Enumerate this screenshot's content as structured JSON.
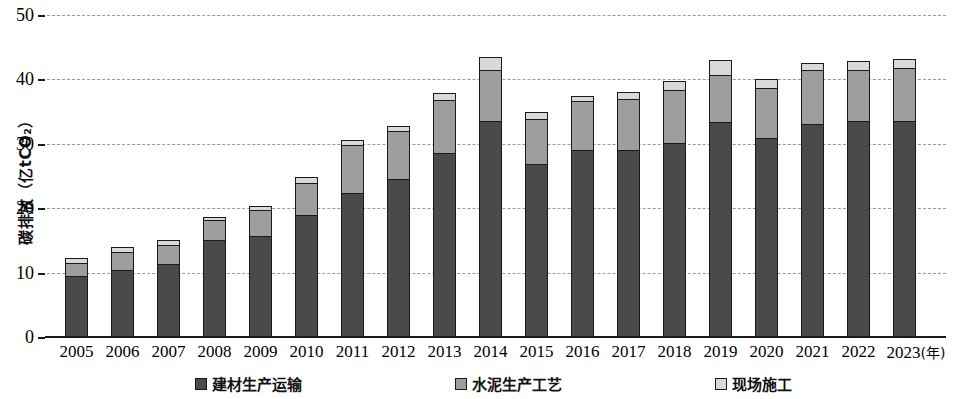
{
  "chart_data": {
    "type": "bar",
    "stacked": true,
    "title": "",
    "xlabel": "年",
    "ylabel": "碳排放（亿tCO₂）",
    "ylim": [
      0,
      50
    ],
    "yticks": [
      0,
      10,
      20,
      30,
      40,
      50
    ],
    "grid": true,
    "legend_position": "bottom",
    "categories": [
      "2005",
      "2006",
      "2007",
      "2008",
      "2009",
      "2010",
      "2011",
      "2012",
      "2013",
      "2014",
      "2015",
      "2016",
      "2017",
      "2018",
      "2019",
      "2020",
      "2021",
      "2022",
      "2023"
    ],
    "series": [
      {
        "name": "建材生产运输",
        "color": "#4a4a4a",
        "values": [
          9.5,
          10.4,
          11.4,
          15.0,
          15.7,
          18.9,
          22.3,
          24.6,
          28.5,
          33.6,
          26.9,
          29.0,
          29.0,
          30.1,
          33.4,
          30.9,
          33.1,
          33.5,
          33.6
        ]
      },
      {
        "name": "水泥生产工艺",
        "color": "#9e9e9e",
        "values": [
          2.0,
          2.8,
          2.9,
          3.1,
          4.0,
          5.0,
          7.5,
          7.4,
          8.3,
          7.9,
          7.0,
          7.6,
          8.0,
          8.3,
          7.3,
          7.8,
          8.3,
          8.0,
          8.2
        ]
      },
      {
        "name": "现场施工",
        "color": "#d9d9d9",
        "values": [
          0.8,
          0.8,
          0.7,
          0.6,
          0.7,
          0.9,
          0.8,
          0.8,
          1.1,
          2.0,
          1.1,
          0.9,
          1.0,
          1.3,
          2.3,
          1.4,
          1.2,
          1.3,
          1.3
        ]
      }
    ],
    "totals": [
      12.3,
      14.0,
      15.0,
      18.7,
      20.4,
      24.8,
      30.6,
      32.8,
      37.9,
      43.5,
      35.0,
      37.5,
      38.0,
      39.7,
      43.0,
      40.1,
      42.6,
      42.8,
      43.1
    ]
  },
  "axis": {
    "y_title": "碳排放（亿tCO₂）",
    "y_tick_labels": [
      "0",
      "10",
      "20",
      "30",
      "40",
      "50"
    ],
    "x_unit_label": "(年)"
  },
  "legend": {
    "items": [
      {
        "label": "建材生产运输",
        "swatch": "#4a4a4a"
      },
      {
        "label": "水泥生产工艺",
        "swatch": "#9e9e9e"
      },
      {
        "label": "现场施工",
        "swatch": "#d9d9d9"
      }
    ]
  }
}
